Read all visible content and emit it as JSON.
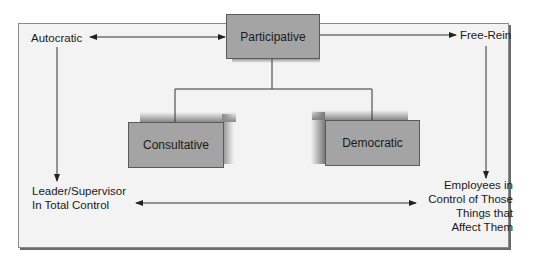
{
  "diagram": {
    "title_box": "Participative",
    "left_top": "Autocratic",
    "right_top": "Free-Rein",
    "child_left": "Consultative",
    "child_right": "Democratic",
    "left_bottom": [
      "Leader/Supervisor",
      "In Total Control"
    ],
    "right_bottom": [
      "Employees in",
      "Control of Those",
      "Things that",
      "Affect Them"
    ]
  },
  "colors": {
    "box_fill": "#a4a4a4",
    "frame_fill": "#f3f3f3",
    "line": "#333333"
  },
  "edges": [
    {
      "from": "Autocratic",
      "to": "Participative",
      "type": "bidirectional"
    },
    {
      "from": "Participative",
      "to": "Free-Rein",
      "type": "arrow"
    },
    {
      "from": "Autocratic",
      "to": "Leader/Supervisor In Total Control",
      "type": "arrow"
    },
    {
      "from": "Free-Rein",
      "to": "Employees in Control of Those Things that Affect Them",
      "type": "arrow"
    },
    {
      "from": "Participative",
      "to": "Consultative",
      "type": "line"
    },
    {
      "from": "Participative",
      "to": "Democratic",
      "type": "line"
    },
    {
      "from": "Leader/Supervisor In Total Control",
      "to": "Employees in Control of Those Things that Affect Them",
      "type": "bidirectional"
    }
  ]
}
